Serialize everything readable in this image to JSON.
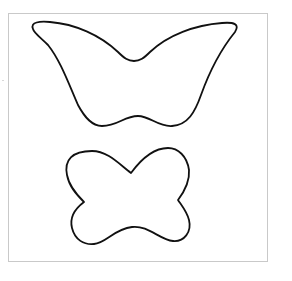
{
  "page": {
    "background_color": "#ffffff",
    "border_color": "#c9c9c9",
    "stroke_color": "#111111"
  },
  "shapes": [
    {
      "name": "large-wing-outline",
      "kind": "outline",
      "label": ""
    },
    {
      "name": "small-bow-outline",
      "kind": "outline",
      "label": ""
    }
  ]
}
